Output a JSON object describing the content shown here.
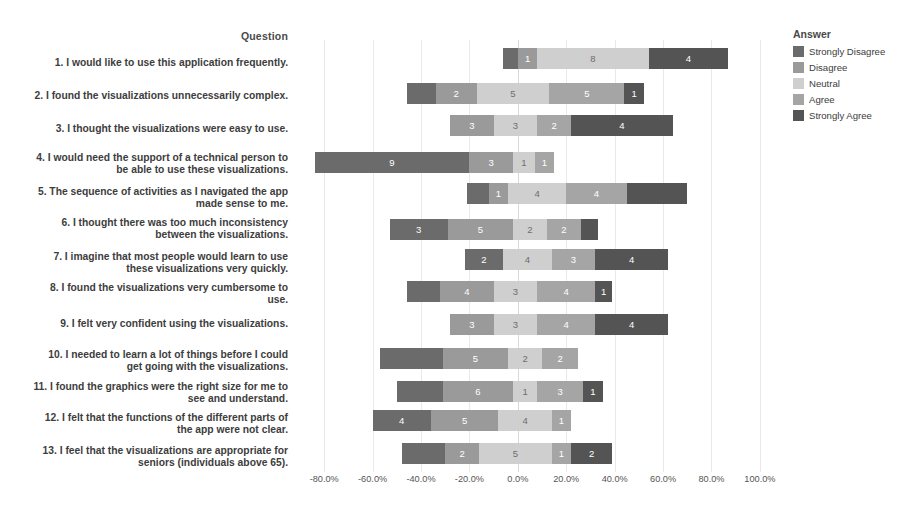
{
  "header": {
    "question_column_title": "Question"
  },
  "legend": {
    "title": "Answer",
    "items": [
      {
        "label": "Strongly Disagree",
        "color": "#6b6b6b"
      },
      {
        "label": "Disagree",
        "color": "#9a9a9a"
      },
      {
        "label": "Neutral",
        "color": "#cfcfcf"
      },
      {
        "label": "Agree",
        "color": "#a5a5a5"
      },
      {
        "label": "Strongly Agree",
        "color": "#545454"
      }
    ]
  },
  "axis": {
    "ticks": [
      "-80.0%",
      "-60.0%",
      "-40.0%",
      "-20.0%",
      "0.0%",
      "20.0%",
      "40.0%",
      "60.0%",
      "80.0%",
      "100.0%"
    ],
    "tick_values": [
      -80,
      -60,
      -40,
      -20,
      0,
      20,
      40,
      60,
      80,
      100
    ],
    "xmin": -90,
    "xmax": 105
  },
  "chart_data": {
    "type": "bar",
    "subtype": "diverging-stacked-likert",
    "title": "",
    "xlabel": "",
    "ylabel": "Question",
    "xlim": [
      -90,
      105
    ],
    "grid": true,
    "legend_position": "right",
    "categories_legend": [
      "Strongly Disagree",
      "Disagree",
      "Neutral",
      "Agree",
      "Strongly Agree"
    ],
    "value_unit": "count",
    "questions": [
      "1. I would like to use this application frequently.",
      "2. I found the visualizations unnecessarily complex.",
      "3. I thought the visualizations were easy to use.",
      "4. I would need the support of a technical person to\nbe able to use these visualizations.",
      "5. The sequence of activities as I navigated the app\nmade sense to me.",
      "6. I thought there was too much inconsistency\nbetween the visualizations.",
      "7. I imagine that most people would learn to use\nthese visualizations very quickly.",
      "8. I found the visualizations very cumbersome to\nuse.",
      "9. I felt very confident using the visualizations.",
      "10. I needed to learn a lot of things before I could\nget going with the visualizations.",
      "11. I found the graphics were the right size for me to\nsee and understand.",
      "12. I felt that the functions of the different parts of\nthe app were not clear.",
      "13. I feel that the visualizations are appropriate for\nseniors (individuals above 65)."
    ],
    "rows": [
      {
        "question_index": 1,
        "values": {
          "Strongly Disagree": 0,
          "Disagree": 1,
          "Neutral": 8,
          "Agree": 0,
          "Strongly Agree": 4
        },
        "segments": [
          {
            "cat": "Strongly Disagree",
            "value": 0,
            "label": "",
            "start": -6,
            "end": 0
          },
          {
            "cat": "Disagree",
            "value": 1,
            "label": "1",
            "start": 0,
            "end": 8
          },
          {
            "cat": "Neutral",
            "value": 8,
            "label": "8",
            "start": 8,
            "end": 54
          },
          {
            "cat": "Strongly Agree",
            "value": 4,
            "label": "4",
            "start": 54,
            "end": 87
          }
        ]
      },
      {
        "question_index": 2,
        "values": {
          "Strongly Disagree": 1,
          "Disagree": 2,
          "Neutral": 5,
          "Agree": 5,
          "Strongly Agree": 1
        },
        "segments": [
          {
            "cat": "Strongly Disagree",
            "value": 1,
            "label": "",
            "start": -46,
            "end": -34
          },
          {
            "cat": "Disagree",
            "value": 2,
            "label": "2",
            "start": -34,
            "end": -17
          },
          {
            "cat": "Neutral",
            "value": 5,
            "label": "5",
            "start": -17,
            "end": 13
          },
          {
            "cat": "Agree",
            "value": 5,
            "label": "5",
            "start": 13,
            "end": 44
          },
          {
            "cat": "Strongly Agree",
            "value": 1,
            "label": "1",
            "start": 44,
            "end": 52
          }
        ]
      },
      {
        "question_index": 3,
        "values": {
          "Strongly Disagree": 0,
          "Disagree": 3,
          "Neutral": 3,
          "Agree": 2,
          "Strongly Agree": 4
        },
        "segments": [
          {
            "cat": "Disagree",
            "value": 3,
            "label": "3",
            "start": -28,
            "end": -10
          },
          {
            "cat": "Neutral",
            "value": 3,
            "label": "3",
            "start": -10,
            "end": 8
          },
          {
            "cat": "Agree",
            "value": 2,
            "label": "2",
            "start": 8,
            "end": 22
          },
          {
            "cat": "Strongly Agree",
            "value": 4,
            "label": "4",
            "start": 22,
            "end": 64
          }
        ]
      },
      {
        "question_index": 4,
        "values": {
          "Strongly Disagree": 9,
          "Disagree": 3,
          "Neutral": 1,
          "Agree": 1,
          "Strongly Agree": 0
        },
        "segments": [
          {
            "cat": "Strongly Disagree",
            "value": 9,
            "label": "9",
            "start": -84,
            "end": -20
          },
          {
            "cat": "Disagree",
            "value": 3,
            "label": "3",
            "start": -20,
            "end": -2
          },
          {
            "cat": "Neutral",
            "value": 1,
            "label": "1",
            "start": -2,
            "end": 7
          },
          {
            "cat": "Agree",
            "value": 1,
            "label": "1",
            "start": 7,
            "end": 15
          }
        ]
      },
      {
        "question_index": 5,
        "values": {
          "Strongly Disagree": 1,
          "Disagree": 1,
          "Neutral": 4,
          "Agree": 4,
          "Strongly Agree": 3
        },
        "segments": [
          {
            "cat": "Strongly Disagree",
            "value": 1,
            "label": "",
            "start": -21,
            "end": -12
          },
          {
            "cat": "Disagree",
            "value": 1,
            "label": "1",
            "start": -12,
            "end": -4
          },
          {
            "cat": "Neutral",
            "value": 4,
            "label": "4",
            "start": -4,
            "end": 20
          },
          {
            "cat": "Agree",
            "value": 4,
            "label": "4",
            "start": 20,
            "end": 45
          },
          {
            "cat": "Strongly Agree",
            "value": 3,
            "label": "",
            "start": 45,
            "end": 70
          }
        ]
      },
      {
        "question_index": 6,
        "values": {
          "Strongly Disagree": 3,
          "Disagree": 5,
          "Neutral": 2,
          "Agree": 2,
          "Strongly Agree": 1
        },
        "segments": [
          {
            "cat": "Strongly Disagree",
            "value": 3,
            "label": "3",
            "start": -53,
            "end": -29
          },
          {
            "cat": "Disagree",
            "value": 5,
            "label": "5",
            "start": -29,
            "end": -2
          },
          {
            "cat": "Neutral",
            "value": 2,
            "label": "2",
            "start": -2,
            "end": 12
          },
          {
            "cat": "Agree",
            "value": 2,
            "label": "2",
            "start": 12,
            "end": 26
          },
          {
            "cat": "Strongly Agree",
            "value": 1,
            "label": "",
            "start": 26,
            "end": 33
          }
        ]
      },
      {
        "question_index": 7,
        "values": {
          "Strongly Disagree": 2,
          "Disagree": 0,
          "Neutral": 4,
          "Agree": 3,
          "Strongly Agree": 4
        },
        "segments": [
          {
            "cat": "Strongly Disagree",
            "value": 2,
            "label": "2",
            "start": -22,
            "end": -6
          },
          {
            "cat": "Neutral",
            "value": 4,
            "label": "4",
            "start": -6,
            "end": 14
          },
          {
            "cat": "Agree",
            "value": 3,
            "label": "3",
            "start": 14,
            "end": 32
          },
          {
            "cat": "Strongly Agree",
            "value": 4,
            "label": "4",
            "start": 32,
            "end": 62
          }
        ]
      },
      {
        "question_index": 8,
        "values": {
          "Strongly Disagree": 2,
          "Disagree": 4,
          "Neutral": 3,
          "Agree": 4,
          "Strongly Agree": 1
        },
        "segments": [
          {
            "cat": "Strongly Disagree",
            "value": 2,
            "label": "",
            "start": -46,
            "end": -32
          },
          {
            "cat": "Disagree",
            "value": 4,
            "label": "4",
            "start": -32,
            "end": -10
          },
          {
            "cat": "Neutral",
            "value": 3,
            "label": "3",
            "start": -10,
            "end": 8
          },
          {
            "cat": "Agree",
            "value": 4,
            "label": "4",
            "start": 8,
            "end": 32
          },
          {
            "cat": "Strongly Agree",
            "value": 1,
            "label": "1",
            "start": 32,
            "end": 39
          }
        ]
      },
      {
        "question_index": 9,
        "values": {
          "Strongly Disagree": 0,
          "Disagree": 3,
          "Neutral": 3,
          "Agree": 4,
          "Strongly Agree": 4
        },
        "segments": [
          {
            "cat": "Disagree",
            "value": 3,
            "label": "3",
            "start": -28,
            "end": -10
          },
          {
            "cat": "Neutral",
            "value": 3,
            "label": "3",
            "start": -10,
            "end": 8
          },
          {
            "cat": "Agree",
            "value": 4,
            "label": "4",
            "start": 8,
            "end": 32
          },
          {
            "cat": "Strongly Agree",
            "value": 4,
            "label": "4",
            "start": 32,
            "end": 62
          }
        ]
      },
      {
        "question_index": 10,
        "values": {
          "Strongly Disagree": 4,
          "Disagree": 5,
          "Neutral": 2,
          "Agree": 2,
          "Strongly Agree": 0
        },
        "segments": [
          {
            "cat": "Strongly Disagree",
            "value": 4,
            "label": "",
            "start": -57,
            "end": -31
          },
          {
            "cat": "Disagree",
            "value": 5,
            "label": "5",
            "start": -31,
            "end": -4
          },
          {
            "cat": "Neutral",
            "value": 2,
            "label": "2",
            "start": -4,
            "end": 10
          },
          {
            "cat": "Agree",
            "value": 2,
            "label": "2",
            "start": 10,
            "end": 25
          }
        ]
      },
      {
        "question_index": 11,
        "values": {
          "Strongly Disagree": 3,
          "Disagree": 6,
          "Neutral": 1,
          "Agree": 3,
          "Strongly Agree": 1
        },
        "segments": [
          {
            "cat": "Strongly Disagree",
            "value": 3,
            "label": "",
            "start": -50,
            "end": -31
          },
          {
            "cat": "Disagree",
            "value": 6,
            "label": "6",
            "start": -31,
            "end": -2
          },
          {
            "cat": "Neutral",
            "value": 1,
            "label": "1",
            "start": -2,
            "end": 8
          },
          {
            "cat": "Agree",
            "value": 3,
            "label": "3",
            "start": 8,
            "end": 27
          },
          {
            "cat": "Strongly Agree",
            "value": 1,
            "label": "1",
            "start": 27,
            "end": 35
          }
        ]
      },
      {
        "question_index": 12,
        "values": {
          "Strongly Disagree": 4,
          "Disagree": 5,
          "Neutral": 4,
          "Agree": 1,
          "Strongly Agree": 0
        },
        "segments": [
          {
            "cat": "Strongly Disagree",
            "value": 4,
            "label": "4",
            "start": -60,
            "end": -36
          },
          {
            "cat": "Disagree",
            "value": 5,
            "label": "5",
            "start": -36,
            "end": -8
          },
          {
            "cat": "Neutral",
            "value": 4,
            "label": "4",
            "start": -8,
            "end": 14
          },
          {
            "cat": "Agree",
            "value": 1,
            "label": "1",
            "start": 14,
            "end": 22
          }
        ]
      },
      {
        "question_index": 13,
        "values": {
          "Strongly Disagree": 3,
          "Disagree": 2,
          "Neutral": 5,
          "Agree": 1,
          "Strongly Agree": 2
        },
        "segments": [
          {
            "cat": "Strongly Disagree",
            "value": 3,
            "label": "",
            "start": -48,
            "end": -30
          },
          {
            "cat": "Disagree",
            "value": 2,
            "label": "2",
            "start": -30,
            "end": -16
          },
          {
            "cat": "Neutral",
            "value": 5,
            "label": "5",
            "start": -16,
            "end": 14
          },
          {
            "cat": "Agree",
            "value": 1,
            "label": "1",
            "start": 14,
            "end": 22
          },
          {
            "cat": "Strongly Agree",
            "value": 2,
            "label": "2",
            "start": 22,
            "end": 39
          }
        ]
      }
    ]
  },
  "layout": {
    "row_tops": [
      48,
      83,
      115,
      152,
      183,
      219,
      249,
      281,
      314,
      348,
      381,
      410,
      443
    ],
    "label_tops": [
      57,
      90,
      123,
      152,
      186,
      217,
      251,
      282,
      318,
      349,
      381,
      412,
      445
    ]
  }
}
